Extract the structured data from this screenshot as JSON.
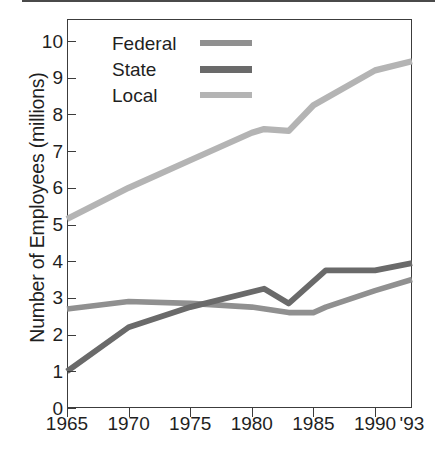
{
  "chart_data": {
    "type": "line",
    "title": "",
    "xlabel": "",
    "ylabel": "Number of Employees (millions)",
    "xlim": [
      1965,
      1993
    ],
    "ylim": [
      0,
      10.6
    ],
    "grid": false,
    "legend_position": "top-left inside plot",
    "x_tick_labels": [
      "1965",
      "1970",
      "1975",
      "1980",
      "1985",
      "1990",
      "'93"
    ],
    "x_tick_values": [
      1965,
      1970,
      1975,
      1980,
      1985,
      1990,
      1993
    ],
    "y_tick_labels": [
      "0",
      "1",
      "2",
      "3",
      "4",
      "5",
      "6",
      "7",
      "8",
      "9",
      "10"
    ],
    "y_tick_values": [
      0,
      1,
      2,
      3,
      4,
      5,
      6,
      7,
      8,
      9,
      10
    ],
    "series": [
      {
        "name": "Federal",
        "color": "#909090",
        "x": [
          1965,
          1970,
          1975,
          1980,
          1983,
          1985,
          1986,
          1990,
          1993
        ],
        "values": [
          2.7,
          2.9,
          2.85,
          2.75,
          2.6,
          2.6,
          2.75,
          3.2,
          3.5
        ]
      },
      {
        "name": "State",
        "color": "#6a6a6a",
        "x": [
          1965,
          1970,
          1975,
          1981,
          1983,
          1986,
          1990,
          1993
        ],
        "values": [
          1.0,
          2.2,
          2.75,
          3.25,
          2.85,
          3.75,
          3.75,
          3.95
        ]
      },
      {
        "name": "Local",
        "color": "#b4b4b4",
        "x": [
          1965,
          1970,
          1975,
          1980,
          1981,
          1983,
          1985,
          1990,
          1993
        ],
        "values": [
          5.15,
          6.0,
          6.75,
          7.5,
          7.6,
          7.55,
          8.25,
          9.2,
          9.45
        ]
      }
    ]
  },
  "axes": {
    "y_title": "Number of Employees (millions)",
    "y_labels": [
      "10",
      "9",
      "8",
      "7",
      "6",
      "5",
      "4",
      "3",
      "2",
      "1",
      "0"
    ],
    "x_labels": [
      "1965",
      "1970",
      "1975",
      "1980",
      "1985",
      "1990",
      "'93"
    ]
  },
  "legend": {
    "items": [
      {
        "label": "Federal",
        "color": "#909090"
      },
      {
        "label": "State",
        "color": "#6a6a6a"
      },
      {
        "label": "Local",
        "color": "#b4b4b4"
      }
    ]
  }
}
